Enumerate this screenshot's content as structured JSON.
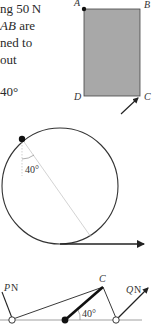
{
  "text_lines": [
    {
      "pre": "ng 50 N",
      "ital": "",
      "post": ""
    },
    {
      "pre": "",
      "ital": "AB",
      "post": " are"
    },
    {
      "pre": "ned to",
      "ital": "",
      "post": ""
    },
    {
      "pre": "out",
      "ital": "",
      "post": ""
    },
    {
      "pre": "",
      "ital": "",
      "post": ""
    },
    {
      "pre": "40°",
      "ital": "",
      "post": ""
    }
  ],
  "figure1": {
    "vertices": {
      "A": "A",
      "B": "B",
      "C": "C",
      "D": "D"
    },
    "fill_color": "#a8a8a8"
  },
  "figure2": {
    "angle_label": "40°"
  },
  "figure3": {
    "point_C": "C",
    "force_P": "P",
    "force_P_unit": "N",
    "force_Q": "Q",
    "force_Q_unit": "N",
    "angle_label": "40°"
  }
}
